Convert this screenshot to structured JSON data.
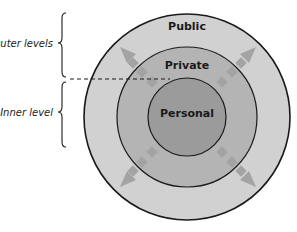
{
  "diagram": {
    "type": "concentric-circles",
    "center": [
      187,
      117
    ],
    "rings": [
      {
        "id": "public",
        "label": "Public",
        "radius": 103,
        "fill": "#d1d1d1",
        "label_pos": [
          187,
          26
        ]
      },
      {
        "id": "private",
        "label": "Private",
        "radius": 70,
        "fill": "#b4b4b4",
        "label_pos": [
          187,
          65
        ]
      },
      {
        "id": "personal",
        "label": "Personal",
        "radius": 39,
        "fill": "#9b9b9b",
        "label_pos": [
          187,
          117
        ]
      }
    ],
    "stroke_color": "#1a1a1a",
    "arrow_color": "#a3a3a3",
    "arrows": [
      {
        "direction": "up-left",
        "tip": [
          120,
          47
        ]
      },
      {
        "direction": "up-right",
        "tip": [
          256,
          47
        ]
      },
      {
        "direction": "down-left",
        "tip": [
          120,
          187
        ]
      },
      {
        "direction": "down-right",
        "tip": [
          256,
          187
        ]
      }
    ],
    "divider": {
      "style": "dashed",
      "y": 79,
      "x_start": 70,
      "x_end": 170
    }
  },
  "annotations": {
    "outer": {
      "label": "Outer levels",
      "brace_top": 13,
      "brace_bottom": 77
    },
    "inner": {
      "label": "Inner level",
      "brace_top": 82,
      "brace_bottom": 147
    }
  }
}
